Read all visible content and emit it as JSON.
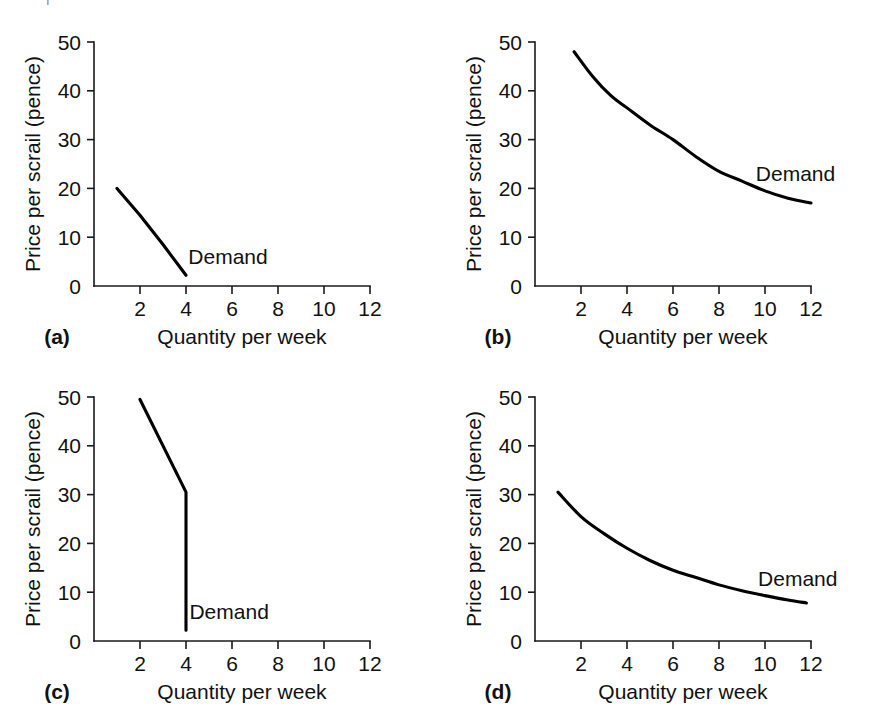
{
  "figure": {
    "background_color": "#ffffff",
    "line_color": "#000000",
    "axis_color": "#1a1a1a",
    "page_fragment": "I"
  },
  "axis_common": {
    "xlabel": "Quantity per week",
    "ylabel": "Price per scrail (pence)",
    "x_ticks": [
      "2",
      "4",
      "6",
      "8",
      "10",
      "12"
    ],
    "y_ticks": [
      "0",
      "10",
      "20",
      "30",
      "40",
      "50"
    ],
    "x_origin_label": "0",
    "series_label": "Demand"
  },
  "panels": [
    {
      "tag": "(a)",
      "name": "panel-a"
    },
    {
      "tag": "(b)",
      "name": "panel-b"
    },
    {
      "tag": "(c)",
      "name": "panel-c"
    },
    {
      "tag": "(d)",
      "name": "panel-d"
    }
  ],
  "chart_data": [
    {
      "type": "line",
      "panel": "(a)",
      "title": "",
      "xlabel": "Quantity per week",
      "ylabel": "Price per scrail (pence)",
      "xlim": [
        0,
        12
      ],
      "ylim": [
        0,
        50
      ],
      "xticks": [
        2,
        4,
        6,
        8,
        10,
        12
      ],
      "yticks": [
        0,
        10,
        20,
        30,
        40,
        50
      ],
      "grid": false,
      "annotations": [
        {
          "text": "Demand",
          "x": 4.1,
          "y": 4.6
        }
      ],
      "series": [
        {
          "name": "Demand",
          "x": [
            1.0,
            2.0,
            3.0,
            4.0
          ],
          "y": [
            20.0,
            14.5,
            8.5,
            2.2
          ]
        }
      ]
    },
    {
      "type": "line",
      "panel": "(b)",
      "title": "",
      "xlabel": "Quantity per week",
      "ylabel": "Price per scrail (pence)",
      "xlim": [
        0,
        12
      ],
      "ylim": [
        0,
        50
      ],
      "xticks": [
        2,
        4,
        6,
        8,
        10,
        12
      ],
      "yticks": [
        0,
        10,
        20,
        30,
        40,
        50
      ],
      "grid": false,
      "annotations": [
        {
          "text": "Demand",
          "x": 9.6,
          "y": 21.5
        }
      ],
      "series": [
        {
          "name": "Demand",
          "x": [
            1.7,
            2.5,
            3.3,
            4.0,
            5.0,
            6.0,
            7.0,
            8.0,
            9.0,
            10.0,
            11.0,
            12.0
          ],
          "y": [
            48.0,
            43.0,
            39.0,
            36.5,
            33.0,
            30.0,
            26.5,
            23.5,
            21.5,
            19.5,
            18.0,
            17.0
          ]
        }
      ]
    },
    {
      "type": "line",
      "panel": "(c)",
      "title": "",
      "xlabel": "Quantity per week",
      "ylabel": "Price per scrail (pence)",
      "xlim": [
        0,
        12
      ],
      "ylim": [
        0,
        50
      ],
      "xticks": [
        2,
        4,
        6,
        8,
        10,
        12
      ],
      "yticks": [
        0,
        10,
        20,
        30,
        40,
        50
      ],
      "grid": false,
      "annotations": [
        {
          "text": "Demand",
          "x": 4.15,
          "y": 4.6
        }
      ],
      "series": [
        {
          "name": "Demand",
          "x": [
            2.0,
            4.0,
            4.0
          ],
          "y": [
            49.5,
            30.5,
            2.2
          ]
        }
      ]
    },
    {
      "type": "line",
      "panel": "(d)",
      "title": "",
      "xlabel": "Quantity per week",
      "ylabel": "Price per scrail (pence)",
      "xlim": [
        0,
        12
      ],
      "ylim": [
        0,
        50
      ],
      "xticks": [
        2,
        4,
        6,
        8,
        10,
        12
      ],
      "yticks": [
        0,
        10,
        20,
        30,
        40,
        50
      ],
      "grid": false,
      "annotations": [
        {
          "text": "Demand",
          "x": 9.7,
          "y": 11.2
        }
      ],
      "series": [
        {
          "name": "Demand",
          "x": [
            1.0,
            2.0,
            3.0,
            4.0,
            5.0,
            6.0,
            7.0,
            8.0,
            9.0,
            10.0,
            11.0,
            11.8
          ],
          "y": [
            30.5,
            25.5,
            22.0,
            19.0,
            16.5,
            14.5,
            13.0,
            11.5,
            10.3,
            9.3,
            8.4,
            7.8
          ]
        }
      ]
    }
  ]
}
